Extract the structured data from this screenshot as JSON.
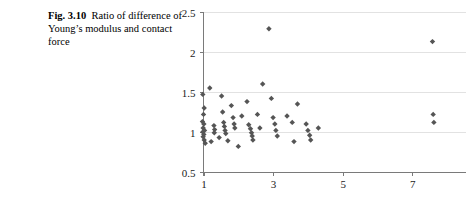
{
  "caption": {
    "label": "Fig. 3.10",
    "text": "Ratio of difference of Young’s modulus and contact force"
  },
  "chart_data": {
    "type": "scatter",
    "title": "",
    "xlabel": "",
    "ylabel": "",
    "xlim": [
      0.6,
      8.0
    ],
    "ylim": [
      0.5,
      2.5
    ],
    "xticks": [
      1,
      3,
      5,
      7
    ],
    "yticks": [
      0.5,
      1,
      1.5,
      2,
      2.5
    ],
    "ytick_labels": [
      "0.5",
      "1",
      "1.5",
      "2",
      "2.5"
    ],
    "xtick_labels": [
      "1",
      "3",
      "5",
      "7"
    ],
    "grid": "horizontal",
    "legend": "none",
    "marker": "diamond",
    "marker_color": "#555555",
    "points": [
      [
        0.98,
        1.47
      ],
      [
        1.02,
        1.3
      ],
      [
        1.0,
        1.22
      ],
      [
        0.97,
        1.13
      ],
      [
        1.01,
        1.1
      ],
      [
        0.99,
        1.05
      ],
      [
        1.03,
        1.02
      ],
      [
        0.98,
        1.0
      ],
      [
        1.01,
        0.97
      ],
      [
        0.99,
        0.94
      ],
      [
        1.02,
        0.9
      ],
      [
        1.05,
        0.86
      ],
      [
        1.18,
        1.55
      ],
      [
        1.22,
        0.88
      ],
      [
        1.3,
        1.08
      ],
      [
        1.32,
        1.03
      ],
      [
        1.31,
        0.99
      ],
      [
        1.45,
        0.93
      ],
      [
        1.52,
        1.45
      ],
      [
        1.55,
        1.25
      ],
      [
        1.58,
        1.12
      ],
      [
        1.6,
        1.07
      ],
      [
        1.62,
        1.02
      ],
      [
        1.64,
        0.98
      ],
      [
        1.7,
        0.89
      ],
      [
        1.8,
        1.33
      ],
      [
        1.85,
        1.18
      ],
      [
        1.88,
        1.1
      ],
      [
        1.9,
        1.05
      ],
      [
        2.0,
        0.82
      ],
      [
        2.1,
        1.2
      ],
      [
        2.25,
        1.38
      ],
      [
        2.3,
        1.09
      ],
      [
        2.35,
        1.04
      ],
      [
        2.38,
        0.99
      ],
      [
        2.4,
        0.95
      ],
      [
        2.42,
        0.9
      ],
      [
        2.55,
        1.22
      ],
      [
        2.62,
        1.05
      ],
      [
        2.7,
        1.6
      ],
      [
        2.88,
        2.29
      ],
      [
        2.95,
        1.42
      ],
      [
        3.0,
        1.18
      ],
      [
        3.05,
        1.1
      ],
      [
        3.08,
        1.02
      ],
      [
        3.12,
        0.95
      ],
      [
        3.4,
        1.2
      ],
      [
        3.55,
        1.12
      ],
      [
        3.6,
        0.88
      ],
      [
        3.7,
        1.35
      ],
      [
        3.95,
        1.1
      ],
      [
        4.0,
        1.02
      ],
      [
        4.05,
        0.96
      ],
      [
        4.08,
        0.9
      ],
      [
        4.3,
        1.05
      ],
      [
        7.58,
        2.13
      ],
      [
        7.6,
        1.22
      ],
      [
        7.62,
        1.12
      ]
    ]
  }
}
